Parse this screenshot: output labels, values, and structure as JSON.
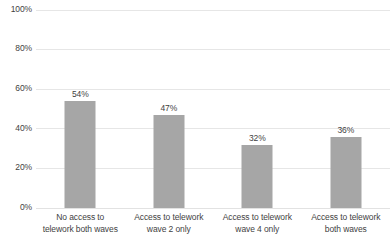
{
  "chart_data": {
    "type": "bar",
    "title": "",
    "xlabel": "",
    "ylabel": "",
    "ylim": [
      0,
      100
    ],
    "ytick_labels": [
      "100%",
      "80%",
      "60%",
      "40%",
      "20%",
      "0%"
    ],
    "ytick_values": [
      100,
      80,
      60,
      40,
      20,
      0
    ],
    "grid": true,
    "legend": "none",
    "categories": [
      "No access to telework both waves",
      "Access to telework wave 2 only",
      "Access to telework wave 4 only",
      "Access to telework both waves"
    ],
    "category_lines": [
      [
        "No access to",
        "telework both waves"
      ],
      [
        "Access to telework",
        "wave 2 only"
      ],
      [
        "Access to telework",
        "wave 4 only"
      ],
      [
        "Access to telework",
        "both waves"
      ]
    ],
    "values": [
      54,
      47,
      32,
      36
    ],
    "data_labels": [
      "54%",
      "47%",
      "32%",
      "36%"
    ],
    "bar_color": "#a6a6a6",
    "gridline_color": "#e6e6e6",
    "text_color": "#3f3f3f",
    "background_color": "#ffffff"
  }
}
